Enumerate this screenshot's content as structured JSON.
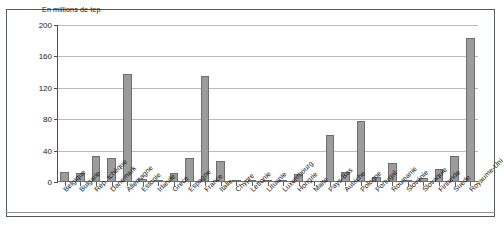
{
  "chart_data": {
    "type": "bar",
    "title": "",
    "subtitle": "",
    "axis_note": "En millions de tep",
    "xlabel": "",
    "ylabel": "En millions de tep",
    "ylim": [
      0,
      200
    ],
    "yticks": [
      0,
      40,
      80,
      120,
      160,
      200
    ],
    "ytick_labels": [
      "0",
      "40",
      "80",
      "120",
      "160",
      "200"
    ],
    "grid": true,
    "legend": false,
    "legend_position": "none",
    "bar_color": "#9c9c9c",
    "bar_edge_color": "#6e6e6e",
    "categories": [
      "Belgique",
      "Bulgarie",
      "Rép. tchèque",
      "Danemark",
      "Allemagne",
      "Estonie",
      "Irlande",
      "Grèce",
      "Espagne",
      "France",
      "Italie",
      "Chypre",
      "Lettonie",
      "Lituanie",
      "Luxembourg",
      "Hongrie",
      "Malte",
      "Pays-Bas",
      "Autriche",
      "Pologne",
      "Portugal",
      "Roumanie",
      "Slovénie",
      "Slovaquie",
      "Finlande",
      "Suède",
      "Royaume-Uni"
    ],
    "values": [
      13,
      11,
      33,
      30,
      137,
      4,
      2,
      11,
      31,
      135,
      27,
      1,
      1,
      3,
      2,
      10,
      0,
      60,
      13,
      78,
      6,
      24,
      2,
      5,
      17,
      33,
      183
    ],
    "series": [
      {
        "name": "Consommation",
        "values": [
          13,
          11,
          33,
          30,
          137,
          4,
          2,
          11,
          31,
          135,
          27,
          1,
          1,
          3,
          2,
          10,
          0,
          60,
          13,
          78,
          6,
          24,
          2,
          5,
          17,
          33,
          183
        ]
      }
    ]
  }
}
